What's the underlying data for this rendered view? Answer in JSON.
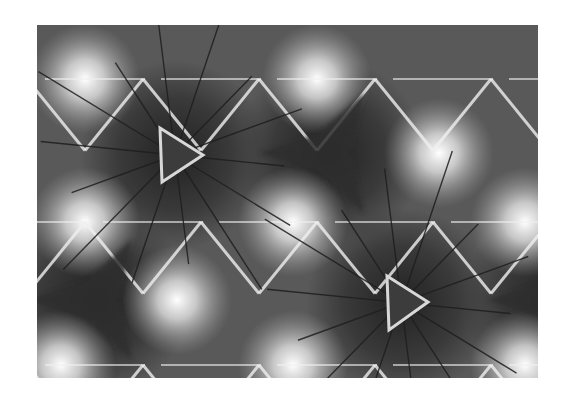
{
  "figure": {
    "x": 37,
    "y": 25,
    "width": 501,
    "height": 353,
    "background": "#575757",
    "colors": {
      "dark": "#2e2e2e",
      "mid": "#6a6a6a",
      "light": "#f4f4f4",
      "line_dark": "#1e1e1e",
      "line_light": "#f0f0f0"
    },
    "outlined_triangles": [
      {
        "points": [
          [
            123,
            103
          ],
          [
            166,
            130
          ],
          [
            125,
            157
          ]
        ]
      },
      {
        "points": [
          [
            350,
            251
          ],
          [
            391,
            277
          ],
          [
            352,
            305
          ]
        ]
      }
    ],
    "dark_centers": [
      {
        "cx": 292,
        "cy": 128
      },
      {
        "cx": 60,
        "cy": 275
      },
      {
        "cx": 520,
        "cy": 275
      }
    ],
    "bright_nodes": [
      {
        "cx": 48,
        "cy": 54
      },
      {
        "cx": 280,
        "cy": 54
      },
      {
        "cx": 402,
        "cy": 128
      },
      {
        "cx": 48,
        "cy": 197
      },
      {
        "cx": 256,
        "cy": 197
      },
      {
        "cx": 488,
        "cy": 197
      },
      {
        "cx": 140,
        "cy": 275
      },
      {
        "cx": 256,
        "cy": 340
      },
      {
        "cx": 488,
        "cy": 340
      },
      {
        "cx": 24,
        "cy": 340
      }
    ]
  }
}
